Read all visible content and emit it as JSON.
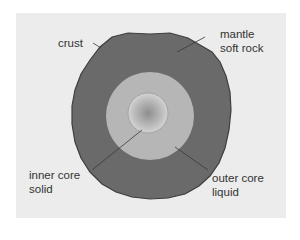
{
  "diagram": {
    "colors": {
      "background": "#ececec",
      "mantle": "#6a6a6a",
      "outer_core": "#b6b6b6",
      "inner_core_edge": "#d4d4d4",
      "inner_core_center": "#8e8e8e",
      "leader_lines": "#3a3a3a",
      "text": "#333333"
    },
    "layers": [
      {
        "id": "crust",
        "label": "crust"
      },
      {
        "id": "mantle",
        "label": "mantle",
        "sublabel": "soft rock"
      },
      {
        "id": "outer-core",
        "label": "outer core",
        "sublabel": "liquid"
      },
      {
        "id": "inner-core",
        "label": "inner core",
        "sublabel": "solid"
      }
    ]
  }
}
